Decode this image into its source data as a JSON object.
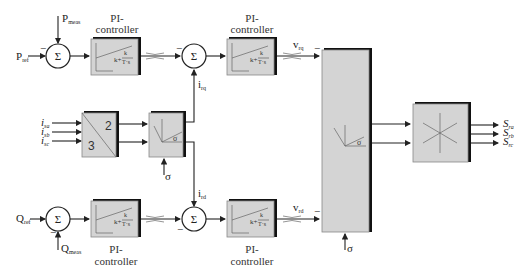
{
  "diagram": {
    "title": "",
    "inputs": {
      "p_ref": {
        "main": "P",
        "sub": "ref"
      },
      "p_meas": {
        "main": "P",
        "sub": "meas"
      },
      "q_ref": {
        "main": "Q",
        "sub": "ref"
      },
      "q_meas": {
        "main": "Q",
        "sub": "meas"
      },
      "i_a": {
        "main": "i",
        "sub": "sa"
      },
      "i_b": {
        "main": "i",
        "sub": "sb"
      },
      "i_c": {
        "main": "i",
        "sub": "sc"
      },
      "sigma": "σ"
    },
    "signals": {
      "i_rq": {
        "main": "i",
        "sub": "rq"
      },
      "i_rd": {
        "main": "i",
        "sub": "rd"
      },
      "v_rq": {
        "main": "v",
        "sub": "rq"
      },
      "v_rd": {
        "main": "v",
        "sub": "rd"
      }
    },
    "outputs": [
      {
        "main": "S",
        "sub": "ra"
      },
      {
        "main": "S",
        "sub": "rb"
      },
      {
        "main": "S",
        "sub": "rc"
      }
    ],
    "sum_symbol": "Σ",
    "minus_sign": "−",
    "pi_controller": {
      "label_line1": "PI-",
      "label_line2": "controller",
      "formula_k": "k",
      "formula_plus": "+",
      "formula_num": "k",
      "formula_den": "T·s"
    },
    "transform_3to2": {
      "top": "2",
      "bottom": "3"
    },
    "rotation_angle": "σ",
    "blocks": [
      "sum-p",
      "pi-p-power",
      "sum-iq",
      "pi-iq-current",
      "sum-q",
      "pi-q-power",
      "sum-id",
      "pi-id-current",
      "abc-to-alphabeta",
      "rotation-transform",
      "inverse-rotation",
      "svm-modulator"
    ]
  }
}
